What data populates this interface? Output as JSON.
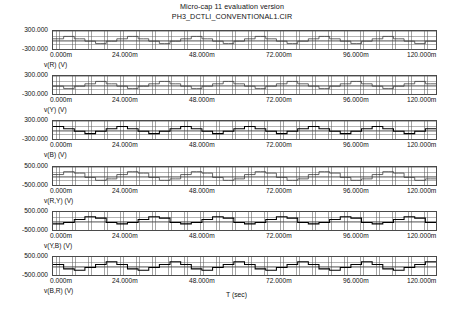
{
  "title": {
    "line1": "Micro-cap 11 evaluation version",
    "line2": "PH3_DCTLI_CONVENTIONAL1.CIR"
  },
  "xaxis": {
    "label": "T (sec)",
    "ticks": [
      "0.000m",
      "24.000m",
      "48.000m",
      "72.000m",
      "96.000m",
      "120.000m"
    ],
    "min_ms": 0,
    "max_ms": 120
  },
  "chart_data": {
    "type": "line",
    "title": "Micro-cap 11 evaluation version",
    "subtitle": "PH3_DCTLI_CONVENTIONAL1.CIR",
    "xlabel": "T (sec)",
    "xlim": [
      0,
      0.12
    ],
    "xticks": [
      "0.000m",
      "24.000m",
      "48.000m",
      "72.000m",
      "96.000m",
      "120.000m"
    ],
    "grid": true,
    "legend": "none",
    "panels": [
      {
        "name": "v(R) (V)",
        "ylabel": "v(R) (V)",
        "yticks": [
          "300.000",
          "-300.000"
        ],
        "ylim": [
          -300,
          300
        ],
        "stroke": "faint",
        "description": "Diode clamped three-level inverter phase R stepped voltage, 50 Hz fundamental over 6 cycles",
        "values": [
          40,
          40,
          120,
          120,
          40,
          40,
          -40,
          -40,
          -120,
          -120,
          -40,
          -40,
          40,
          40,
          120,
          120,
          40,
          40,
          -40,
          -40,
          -120,
          -120,
          -40,
          -40,
          40,
          40,
          120,
          120,
          40,
          40,
          -40,
          -40,
          -120,
          -120,
          -40,
          -40,
          40,
          40,
          120,
          120,
          40,
          40,
          -40,
          -40,
          -120,
          -120,
          -40,
          -40,
          40,
          40,
          120,
          120,
          40,
          40,
          -40,
          -40,
          -120,
          -120,
          -40,
          -40,
          40,
          40,
          120,
          120,
          40,
          40,
          -40,
          -40,
          -120,
          -120,
          -40,
          -40
        ]
      },
      {
        "name": "v(Y) (V)",
        "ylabel": "v(Y) (V)",
        "yticks": [
          "300.000",
          "-300.000"
        ],
        "ylim": [
          -300,
          300
        ],
        "stroke": "faint",
        "description": "Phase Y stepped voltage, shifted 120 degrees from phase R",
        "values": [
          -40,
          -40,
          -120,
          -120,
          -40,
          -40,
          40,
          40,
          120,
          120,
          40,
          40,
          -40,
          -40,
          -120,
          -120,
          -40,
          -40,
          40,
          40,
          120,
          120,
          40,
          40,
          -40,
          -40,
          -120,
          -120,
          -40,
          -40,
          40,
          40,
          120,
          120,
          40,
          40,
          -40,
          -40,
          -120,
          -120,
          -40,
          -40,
          40,
          40,
          120,
          120,
          40,
          40,
          -40,
          -40,
          -120,
          -120,
          -40,
          -40,
          40,
          40,
          120,
          120,
          40,
          40,
          -40,
          -40,
          -120,
          -120,
          -40,
          -40,
          40,
          40,
          120,
          120,
          40,
          40
        ]
      },
      {
        "name": "v(B) (V)",
        "ylabel": "v(B) (V)",
        "yticks": [
          "300.000",
          "-300.000"
        ],
        "ylim": [
          -300,
          300
        ],
        "stroke": "bold",
        "description": "Phase B stepped voltage, shifted 240 degrees from phase R",
        "values": [
          120,
          120,
          40,
          40,
          -40,
          -40,
          -120,
          -120,
          -40,
          -40,
          40,
          40,
          120,
          120,
          40,
          40,
          -40,
          -40,
          -120,
          -120,
          -40,
          -40,
          40,
          40,
          120,
          120,
          40,
          40,
          -40,
          -40,
          -120,
          -120,
          -40,
          -40,
          40,
          40,
          120,
          120,
          40,
          40,
          -40,
          -40,
          -120,
          -120,
          -40,
          -40,
          40,
          40,
          120,
          120,
          40,
          40,
          -40,
          -40,
          -120,
          -120,
          -40,
          -40,
          40,
          40,
          120,
          120,
          40,
          40,
          -40,
          -40,
          -120,
          -120,
          -40,
          -40,
          40,
          40
        ]
      },
      {
        "name": "v(R,Y) (V)",
        "ylabel": "v(R,Y) (V)",
        "yticks": [
          "500.000",
          "-500.000"
        ],
        "ylim": [
          -500,
          500
        ],
        "stroke": "faint",
        "description": "Line-to-line voltage R to Y, multilevel staircase",
        "values": [
          80,
          80,
          240,
          240,
          160,
          160,
          -80,
          -80,
          -240,
          -240,
          -160,
          -160,
          80,
          80,
          240,
          240,
          160,
          160,
          -80,
          -80,
          -240,
          -240,
          -160,
          -160,
          80,
          80,
          240,
          240,
          160,
          160,
          -80,
          -80,
          -240,
          -240,
          -160,
          -160,
          80,
          80,
          240,
          240,
          160,
          160,
          -80,
          -80,
          -240,
          -240,
          -160,
          -160,
          80,
          80,
          240,
          240,
          160,
          160,
          -80,
          -80,
          -240,
          -240,
          -160,
          -160,
          80,
          80,
          240,
          240,
          160,
          160,
          -80,
          -80,
          -240,
          -240,
          -160,
          -160
        ]
      },
      {
        "name": "v(Y,B) (V)",
        "ylabel": "v(Y,B) (V)",
        "yticks": [
          "500.000",
          "-500.000"
        ],
        "ylim": [
          -500,
          500
        ],
        "stroke": "bold",
        "description": "Line-to-line voltage Y to B, multilevel staircase",
        "values": [
          -160,
          -160,
          -80,
          -80,
          80,
          80,
          240,
          240,
          160,
          160,
          -80,
          -80,
          -160,
          -160,
          -80,
          -80,
          80,
          80,
          240,
          240,
          160,
          160,
          -80,
          -80,
          -160,
          -160,
          -80,
          -80,
          80,
          80,
          240,
          240,
          160,
          160,
          -80,
          -80,
          -160,
          -160,
          -80,
          -80,
          80,
          80,
          240,
          240,
          160,
          160,
          -80,
          -80,
          -160,
          -160,
          -80,
          -80,
          80,
          80,
          240,
          240,
          160,
          160,
          -80,
          -80,
          -160,
          -160,
          -80,
          -80,
          80,
          80,
          240,
          240,
          160,
          160,
          -80,
          -80
        ]
      },
      {
        "name": "v(B,R) (V)",
        "ylabel": "v(B,R) (V)",
        "yticks": [
          "500.000",
          "-500.000"
        ],
        "ylim": [
          -500,
          500
        ],
        "stroke": "bold",
        "description": "Line-to-line voltage B to R, multilevel staircase",
        "values": [
          80,
          80,
          -160,
          -160,
          -240,
          -240,
          -80,
          -80,
          80,
          80,
          240,
          240,
          80,
          80,
          -160,
          -160,
          -240,
          -240,
          -80,
          -80,
          80,
          80,
          240,
          240,
          80,
          80,
          -160,
          -160,
          -240,
          -240,
          -80,
          -80,
          80,
          80,
          240,
          240,
          80,
          80,
          -160,
          -160,
          -240,
          -240,
          -80,
          -80,
          80,
          80,
          240,
          240,
          80,
          80,
          -160,
          -160,
          -240,
          -240,
          -80,
          -80,
          80,
          80,
          240,
          240,
          80,
          80,
          -160,
          -160,
          -240,
          -240,
          -80,
          -80,
          80,
          80,
          240,
          240
        ]
      }
    ]
  }
}
